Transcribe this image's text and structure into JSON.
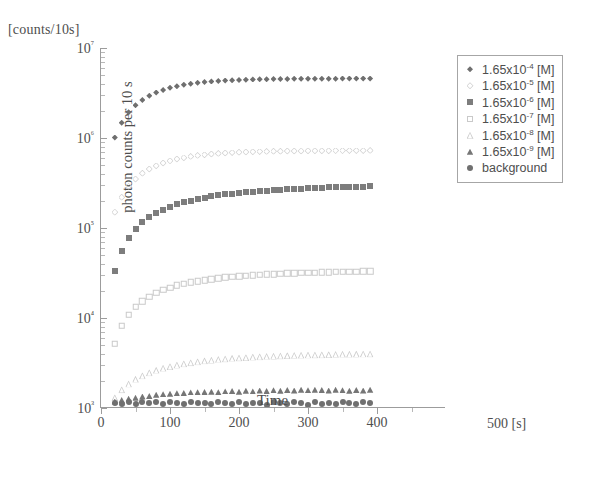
{
  "figure": {
    "units_caption": "[counts/10s]",
    "x_unit_label": "500 [s]"
  },
  "chart_data": {
    "type": "scatter",
    "title": "",
    "xlabel": "Time",
    "ylabel": "photon counts per 10 s",
    "x_unit": "[s]",
    "y_unit": "[counts/10s]",
    "yscale": "log",
    "xscale": "linear",
    "xlim": [
      0,
      500
    ],
    "ylim": [
      1000,
      10000000
    ],
    "grid": false,
    "legend_position": "upper-right",
    "xticks": [
      0,
      100,
      200,
      300,
      400
    ],
    "xtick_labels": [
      "0",
      "100",
      "200",
      "300",
      "400"
    ],
    "yticks": [
      1000,
      10000,
      100000,
      1000000,
      10000000
    ],
    "ytick_labels": [
      "10³",
      "10⁴",
      "10⁵",
      "10⁶",
      "10⁷"
    ],
    "series": [
      {
        "name": "1.65x10⁻⁴ [M]",
        "label_mantissa": "1.65x10",
        "label_exponent": "-4",
        "label_suffix": " [M]",
        "marker": "filled-diamond",
        "color": "#6f6f6f",
        "plateau": 4500000,
        "x": [
          20,
          30,
          40,
          50,
          60,
          70,
          80,
          90,
          100,
          110,
          120,
          130,
          140,
          150,
          160,
          170,
          180,
          190,
          200,
          210,
          220,
          230,
          240,
          250,
          260,
          270,
          280,
          290,
          300,
          310,
          320,
          330,
          340,
          350,
          360,
          370,
          380,
          390
        ],
        "y": [
          1010000,
          1480000,
          1930000,
          2310000,
          2650000,
          2950000,
          3200000,
          3420000,
          3610000,
          3760000,
          3900000,
          4010000,
          4100000,
          4180000,
          4250000,
          4300000,
          4350000,
          4390000,
          4420000,
          4450000,
          4470000,
          4490000,
          4500000,
          4510000,
          4520000,
          4530000,
          4540000,
          4545000,
          4550000,
          4555000,
          4560000,
          4560000,
          4565000,
          4570000,
          4570000,
          4575000,
          4575000,
          4580000
        ]
      },
      {
        "name": "1.65x10⁻⁵ [M]",
        "label_mantissa": "1.65x10",
        "label_exponent": "-5",
        "label_suffix": " [M]",
        "marker": "open-diamond",
        "color": "#cfcfcf",
        "plateau": 700000,
        "x": [
          20,
          30,
          40,
          50,
          60,
          70,
          80,
          90,
          100,
          110,
          120,
          130,
          140,
          150,
          160,
          170,
          180,
          190,
          200,
          210,
          220,
          230,
          240,
          250,
          260,
          270,
          280,
          290,
          300,
          310,
          320,
          330,
          340,
          350,
          360,
          370,
          380,
          390
        ],
        "y": [
          150000,
          220000,
          290000,
          350000,
          405000,
          452000,
          492000,
          527000,
          557000,
          583000,
          605000,
          624000,
          640000,
          653000,
          664000,
          674000,
          682000,
          689000,
          694000,
          699000,
          703000,
          706000,
          709000,
          712000,
          714000,
          716000,
          717000,
          719000,
          720000,
          721000,
          722000,
          723000,
          724000,
          724000,
          725000,
          726000,
          726000,
          727000
        ]
      },
      {
        "name": "1.65x10⁻⁶ [M]",
        "label_mantissa": "1.65x10",
        "label_exponent": "-6",
        "label_suffix": " [M]",
        "marker": "filled-square",
        "color": "#7d7d7d",
        "plateau": 300000,
        "x": [
          20,
          30,
          40,
          50,
          60,
          70,
          80,
          90,
          100,
          110,
          120,
          130,
          140,
          150,
          160,
          170,
          180,
          190,
          200,
          210,
          220,
          230,
          240,
          250,
          260,
          270,
          280,
          290,
          300,
          310,
          320,
          330,
          340,
          350,
          360,
          370,
          380,
          390
        ],
        "y": [
          33000,
          56000,
          78000,
          98000,
          116000,
          132000,
          147000,
          160000,
          172000,
          183000,
          193000,
          202000,
          210000,
          217000,
          224000,
          230000,
          236000,
          241000,
          245000,
          250000,
          254000,
          257000,
          261000,
          264000,
          267000,
          269000,
          272000,
          274000,
          276000,
          278000,
          280000,
          282000,
          284000,
          285000,
          287000,
          288000,
          289000,
          291000
        ]
      },
      {
        "name": "1.65x10⁻⁷ [M]",
        "label_mantissa": "1.65x10",
        "label_exponent": "-7",
        "label_suffix": " [M]",
        "marker": "open-square",
        "color": "#c9c9c9",
        "plateau": 36000,
        "x": [
          20,
          30,
          40,
          50,
          60,
          70,
          80,
          90,
          100,
          110,
          120,
          130,
          140,
          150,
          160,
          170,
          180,
          190,
          200,
          210,
          220,
          230,
          240,
          250,
          260,
          270,
          280,
          290,
          300,
          310,
          320,
          330,
          340,
          350,
          360,
          370,
          380,
          390
        ],
        "y": [
          5200,
          8200,
          10900,
          13300,
          15400,
          17300,
          19000,
          20500,
          21800,
          23000,
          24000,
          24900,
          25700,
          26400,
          27100,
          27700,
          28200,
          28700,
          29100,
          29500,
          29900,
          30200,
          30500,
          30800,
          31000,
          31300,
          31500,
          31700,
          31900,
          32000,
          32200,
          32300,
          32500,
          32600,
          32700,
          32800,
          32900,
          33000
        ]
      },
      {
        "name": "1.65x10⁻⁸ [M]",
        "label_mantissa": "1.65x10",
        "label_exponent": "-8",
        "label_suffix": " [M]",
        "marker": "open-triangle",
        "color": "#cdcdcd",
        "plateau": 4600,
        "x": [
          20,
          30,
          40,
          50,
          60,
          70,
          80,
          90,
          100,
          110,
          120,
          130,
          140,
          150,
          160,
          170,
          180,
          190,
          200,
          210,
          220,
          230,
          240,
          250,
          260,
          270,
          280,
          290,
          300,
          310,
          320,
          330,
          340,
          350,
          360,
          370,
          380,
          390
        ],
        "y": [
          1300,
          1600,
          1850,
          2080,
          2280,
          2460,
          2620,
          2760,
          2890,
          3000,
          3100,
          3190,
          3270,
          3340,
          3400,
          3460,
          3510,
          3560,
          3600,
          3640,
          3680,
          3710,
          3740,
          3770,
          3790,
          3820,
          3840,
          3860,
          3880,
          3890,
          3910,
          3920,
          3940,
          3950,
          3960,
          3970,
          3980,
          3990
        ]
      },
      {
        "name": "1.65x10⁻⁹ [M]",
        "label_mantissa": "1.65x10",
        "label_exponent": "-9",
        "label_suffix": " [M]",
        "marker": "filled-triangle",
        "color": "#767676",
        "plateau": 1500,
        "x": [
          20,
          30,
          40,
          50,
          60,
          70,
          80,
          90,
          100,
          110,
          120,
          130,
          140,
          150,
          160,
          170,
          180,
          190,
          200,
          210,
          220,
          230,
          240,
          250,
          260,
          270,
          280,
          290,
          300,
          310,
          320,
          330,
          340,
          350,
          360,
          370,
          380,
          390
        ],
        "y": [
          1180,
          1230,
          1270,
          1300,
          1340,
          1360,
          1400,
          1420,
          1440,
          1460,
          1470,
          1490,
          1500,
          1510,
          1520,
          1500,
          1530,
          1540,
          1520,
          1550,
          1530,
          1560,
          1540,
          1570,
          1550,
          1580,
          1560,
          1590,
          1570,
          1600,
          1580,
          1560,
          1590,
          1570,
          1550,
          1580,
          1560,
          1600
        ]
      },
      {
        "name": "background",
        "label_mantissa": "background",
        "label_exponent": "",
        "label_suffix": "",
        "marker": "filled-circle",
        "color": "#707070",
        "plateau": 1150,
        "x": [
          20,
          30,
          40,
          50,
          60,
          70,
          80,
          90,
          100,
          110,
          120,
          130,
          140,
          150,
          160,
          170,
          180,
          190,
          200,
          210,
          220,
          230,
          240,
          250,
          260,
          270,
          280,
          290,
          300,
          310,
          320,
          330,
          340,
          350,
          360,
          370,
          380,
          390
        ],
        "y": [
          1150,
          1120,
          1160,
          1100,
          1170,
          1130,
          1180,
          1110,
          1160,
          1140,
          1120,
          1170,
          1130,
          1150,
          1110,
          1160,
          1140,
          1100,
          1170,
          1120,
          1150,
          1130,
          1080,
          1160,
          1140,
          1110,
          1170,
          1130,
          1090,
          1160,
          1120,
          1150,
          1100,
          1170,
          1140,
          1110,
          1160,
          1130
        ]
      }
    ]
  }
}
